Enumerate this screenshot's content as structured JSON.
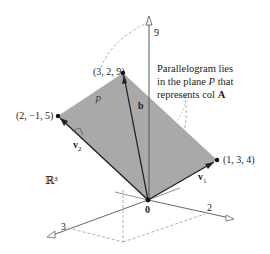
{
  "figure": {
    "space_label": "ℝ³",
    "origin_label": "0",
    "plane_label": "P",
    "vector_b_label": "b",
    "vector_v1_label": "v",
    "vector_v1_sub": "1",
    "vector_v2_label": "v",
    "vector_v2_sub": "2",
    "points": [
      {
        "name": "b",
        "label": "(3, 2, 9)"
      },
      {
        "name": "v2",
        "label": "(2, −1, 5)"
      },
      {
        "name": "v1",
        "label": "(1, 3, 4)"
      }
    ],
    "axis_ticks": {
      "z": "9",
      "x": "3",
      "y": "2"
    },
    "caption": {
      "line1": "Parallelogram lies",
      "line2_pre": "in the plane ",
      "line2_ital": "P",
      "line2_post": " that",
      "line3_pre": "represents col ",
      "line3_bold": "A"
    },
    "colors": {
      "plane_fill": "#a9a9a9",
      "line": "#222222",
      "axis": "#666666",
      "dashed": "#9a9a9a"
    }
  }
}
